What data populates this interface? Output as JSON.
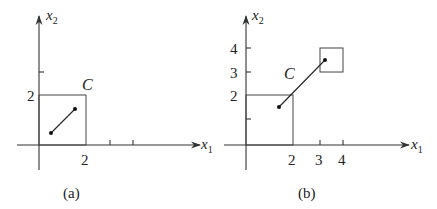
{
  "panels": [
    {
      "id": "a",
      "caption": "(a)",
      "x_axis_label": "x",
      "x_axis_sub": "1",
      "y_axis_label": "x",
      "y_axis_sub": "2",
      "set_label": "C",
      "x_tick_labels": [
        "2"
      ],
      "y_tick_labels": [
        "2"
      ],
      "description": "Square set C = [0,2]x[0,2] with a segment between two points inside it"
    },
    {
      "id": "b",
      "caption": "(b)",
      "x_axis_label": "x",
      "x_axis_sub": "1",
      "y_axis_label": "x",
      "y_axis_sub": "2",
      "set_label": "C",
      "x_tick_labels": [
        "2",
        "3",
        "4"
      ],
      "y_tick_labels": [
        "2",
        "3",
        "4"
      ],
      "description": "Non-convex set C = [0,2]x[0,2] union [3,4]x[3,4] with a segment joining a point in each square, passing outside C"
    }
  ]
}
